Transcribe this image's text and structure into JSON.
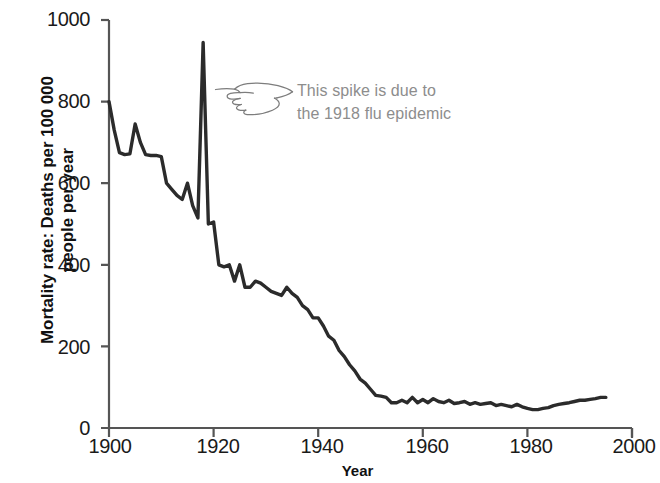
{
  "axes": {
    "y_title_line1": "Mortality rate: Deaths per 100 000",
    "y_title_line2": "people per year",
    "y_title": "Mortality rate: Deaths per 100 000\npeople per year",
    "x_title": "Year",
    "y_ticks": [
      "0",
      "200",
      "400",
      "600",
      "800",
      "1000"
    ],
    "x_ticks": [
      "1900",
      "1920",
      "1940",
      "1960",
      "1980",
      "2000"
    ]
  },
  "annotation": {
    "line1": "This spike is due to",
    "line2": "the 1918 flu epidemic",
    "text": "This spike is due to\nthe 1918 flu epidemic",
    "icon": "pointing-hand-icon",
    "color": "#8d8d8d"
  },
  "colors": {
    "line": "#2b2b2b",
    "axis": "#555555",
    "text": "#1a1a1a",
    "annotation": "#8d8d8d",
    "background": "#ffffff"
  },
  "chart_data": {
    "type": "line",
    "title": "",
    "subtitle": "",
    "xlabel": "Year",
    "ylabel": "Mortality rate: Deaths per 100 000 people per year",
    "xlim": [
      1900,
      2000
    ],
    "ylim": [
      0,
      1000
    ],
    "xticks": [
      1900,
      1920,
      1940,
      1960,
      1980,
      2000
    ],
    "yticks": [
      0,
      200,
      400,
      600,
      800,
      1000
    ],
    "grid": false,
    "legend": null,
    "annotations": [
      {
        "text": "This spike is due to the 1918 flu epidemic",
        "points_to_x": 1918,
        "points_to_y": 945
      }
    ],
    "series": [
      {
        "name": "Mortality rate",
        "x": [
          1900,
          1901,
          1902,
          1903,
          1904,
          1905,
          1906,
          1907,
          1908,
          1909,
          1910,
          1911,
          1912,
          1913,
          1914,
          1915,
          1916,
          1917,
          1918,
          1919,
          1920,
          1921,
          1922,
          1923,
          1924,
          1925,
          1926,
          1927,
          1928,
          1929,
          1930,
          1931,
          1932,
          1933,
          1934,
          1935,
          1936,
          1937,
          1938,
          1939,
          1940,
          1941,
          1942,
          1943,
          1944,
          1945,
          1946,
          1947,
          1948,
          1949,
          1950,
          1951,
          1952,
          1953,
          1954,
          1955,
          1956,
          1957,
          1958,
          1959,
          1960,
          1961,
          1962,
          1963,
          1964,
          1965,
          1966,
          1967,
          1968,
          1969,
          1970,
          1971,
          1972,
          1973,
          1974,
          1975,
          1976,
          1977,
          1978,
          1979,
          1980,
          1981,
          1982,
          1983,
          1984,
          1985,
          1986,
          1987,
          1988,
          1989,
          1990,
          1991,
          1992,
          1993,
          1994,
          1995
        ],
        "values": [
          800,
          730,
          675,
          670,
          672,
          745,
          700,
          670,
          668,
          668,
          665,
          600,
          585,
          570,
          560,
          600,
          545,
          515,
          945,
          500,
          505,
          400,
          395,
          400,
          360,
          400,
          345,
          345,
          360,
          355,
          345,
          335,
          330,
          325,
          345,
          330,
          320,
          300,
          290,
          270,
          270,
          250,
          225,
          215,
          190,
          175,
          155,
          140,
          120,
          110,
          95,
          80,
          78,
          75,
          62,
          62,
          68,
          62,
          75,
          62,
          70,
          62,
          72,
          65,
          62,
          68,
          60,
          62,
          65,
          58,
          62,
          58,
          60,
          62,
          55,
          58,
          55,
          52,
          58,
          52,
          48,
          45,
          45,
          48,
          50,
          55,
          58,
          60,
          62,
          65,
          68,
          68,
          70,
          72,
          75,
          75
        ]
      }
    ]
  }
}
